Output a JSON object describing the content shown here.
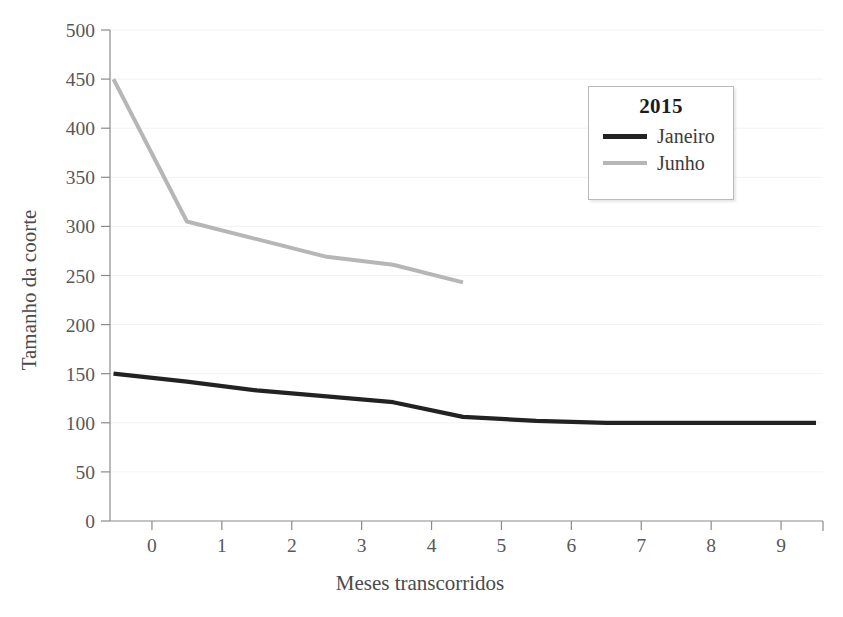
{
  "chart_data": {
    "type": "line",
    "title": "",
    "xlabel": "Meses transcorridos",
    "ylabel": "Tamanho da coorte",
    "xlim": [
      -0.6,
      9.6
    ],
    "ylim": [
      0,
      500
    ],
    "grid": true,
    "legend_position": "top-right",
    "legend_title": "2015",
    "xticks": [
      "0",
      "1",
      "2",
      "3",
      "4",
      "5",
      "6",
      "7",
      "8",
      "9"
    ],
    "yticks": [
      "0",
      "50",
      "100",
      "150",
      "200",
      "250",
      "300",
      "350",
      "400",
      "450",
      "500"
    ],
    "series": [
      {
        "name": "Janeiro",
        "color": "#222222",
        "x": [
          -0.55,
          0.5,
          1.5,
          2.5,
          3.45,
          4.45,
          5.5,
          6.5,
          7.5,
          8.5,
          9.5
        ],
        "values": [
          150,
          142,
          133,
          127,
          121,
          106,
          102,
          100,
          100,
          100,
          100
        ]
      },
      {
        "name": "Junho",
        "color": "#b6b6b6",
        "x": [
          -0.55,
          0.5,
          1.5,
          2.5,
          3.45,
          4.45
        ],
        "values": [
          450,
          305,
          287,
          269,
          261,
          243
        ]
      }
    ]
  },
  "legend": {
    "title": "2015",
    "entries": [
      {
        "label": "Janeiro",
        "color": "#222222"
      },
      {
        "label": "Junho",
        "color": "#b6b6b6"
      }
    ]
  },
  "axes": {
    "x_title": "Meses transcorridos",
    "y_title": "Tamanho da coorte"
  }
}
